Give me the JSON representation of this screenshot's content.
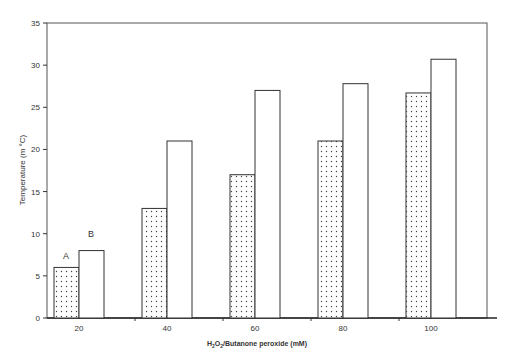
{
  "chart_data": {
    "type": "bar",
    "title": "",
    "xlabel": "H2O2/Butanone peroxide (mM)",
    "ylabel": "Temperature (m °C)",
    "categories": [
      "20",
      "40",
      "60",
      "80",
      "100"
    ],
    "series": [
      {
        "name": "A",
        "values": [
          6,
          13,
          17,
          21,
          26.7
        ],
        "pattern": "dotted"
      },
      {
        "name": "B",
        "values": [
          8,
          21,
          27,
          27.8,
          30.7
        ],
        "pattern": "white"
      }
    ],
    "ylim": [
      0,
      35
    ],
    "yticks": [
      0,
      5,
      10,
      15,
      20,
      25,
      30,
      35
    ],
    "annotations": [
      {
        "text": "A"
      },
      {
        "text": "B"
      }
    ],
    "grid": false,
    "legend": "none"
  }
}
